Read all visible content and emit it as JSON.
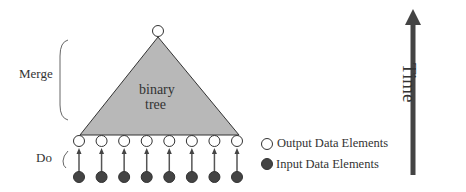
{
  "diagram": {
    "phases": {
      "merge_label": "Merge",
      "do_label": "Do"
    },
    "tree": {
      "label_line1": "binary",
      "label_line2": "tree",
      "fill_color": "#b8b8b8",
      "leaf_count": 8
    },
    "legend": {
      "output_label": "Output Data Elements",
      "input_label": "Input Data Elements",
      "input_color": "#444444"
    },
    "time_axis": {
      "label": "Time",
      "arrow_color": "#444444"
    }
  }
}
